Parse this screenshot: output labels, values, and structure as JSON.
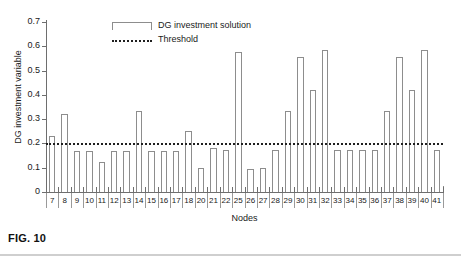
{
  "figure": {
    "caption": "FIG. 10"
  },
  "chart_data": {
    "type": "bar",
    "title": "",
    "xlabel": "Nodes",
    "ylabel": "DG investment variable",
    "ylim": [
      0,
      0.7
    ],
    "ytick_step": 0.1,
    "ytick_labels": [
      "0",
      "0.1",
      "0.2",
      "0.3",
      "0.4",
      "0.5",
      "0.6",
      "0.7"
    ],
    "ytick_values": [
      0,
      0.1,
      0.2,
      0.3,
      0.4,
      0.5,
      0.6,
      0.7
    ],
    "grid": false,
    "legend_position": "top-center",
    "legend": [
      {
        "label": "DG investment solution",
        "marker": "bar-outline"
      },
      {
        "label": "Threshold",
        "marker": "dotted-line"
      }
    ],
    "categories": [
      "7",
      "8",
      "9",
      "10",
      "11",
      "12",
      "13",
      "14",
      "15",
      "16",
      "17",
      "18",
      "20",
      "21",
      "22",
      "25",
      "26",
      "27",
      "28",
      "29",
      "30",
      "31",
      "32",
      "33",
      "34",
      "35",
      "36",
      "37",
      "38",
      "39",
      "40",
      "41"
    ],
    "series": [
      {
        "name": "DG investment solution",
        "values": [
          0.23,
          0.32,
          0.167,
          0.167,
          0.125,
          0.167,
          0.167,
          0.333,
          0.167,
          0.167,
          0.167,
          0.25,
          0.1,
          0.18,
          0.173,
          0.578,
          0.094,
          0.098,
          0.172,
          0.335,
          0.557,
          0.42,
          0.586,
          0.172,
          0.171,
          0.172,
          0.172,
          0.335,
          0.557,
          0.42,
          0.586,
          0.173
        ]
      }
    ],
    "threshold": {
      "label": "Threshold",
      "value": 0.2
    },
    "colors": {
      "bar_outline": "#8d8d8d",
      "bar_fill": "#ffffff",
      "threshold": "#1f1f1f",
      "axis": "#6e6e6e",
      "text": "#1a1a1a"
    }
  }
}
